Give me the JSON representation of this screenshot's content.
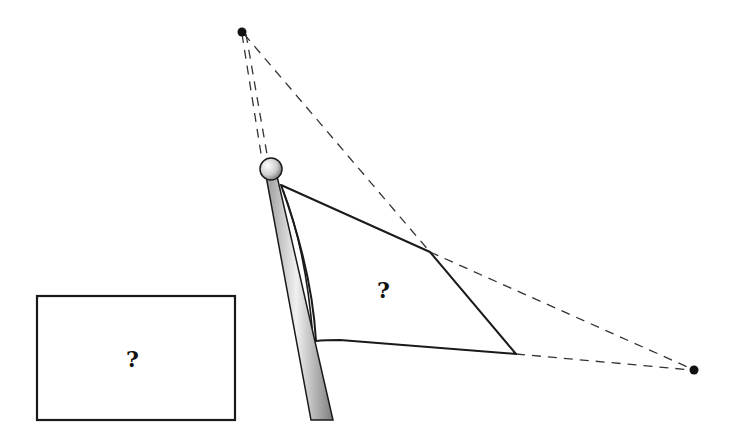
{
  "diagram": {
    "labels": {
      "flag_label": "?",
      "rectangle_label": "?"
    },
    "colors": {
      "line": "#1a1a1a",
      "dashed": "#333333",
      "pole_light": "#f2f2f2",
      "pole_dark": "#8a8a8a"
    },
    "points": {
      "top_point": [
        242,
        32
      ],
      "right_point": [
        694,
        370
      ],
      "pole_top": [
        271,
        170
      ],
      "flag_corners": [
        [
          281,
          185
        ],
        [
          430,
          252
        ],
        [
          516,
          354
        ],
        [
          316,
          341
        ]
      ]
    },
    "rectangle": {
      "x": 36,
      "y": 295,
      "width": 200,
      "height": 125
    }
  }
}
